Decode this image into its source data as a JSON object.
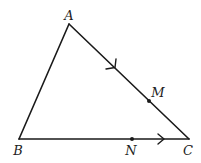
{
  "diagram": {
    "type": "geometry-triangle",
    "colors": {
      "stroke": "#1a1a1a",
      "label": "#222222",
      "background": "#ffffff"
    },
    "vertices": [
      {
        "id": "A",
        "label": "A",
        "x": 69,
        "y": 24,
        "label_x": 69,
        "label_y": 20
      },
      {
        "id": "B",
        "label": "B",
        "x": 19,
        "y": 139,
        "label_x": 18,
        "label_y": 155
      },
      {
        "id": "C",
        "label": "C",
        "x": 189,
        "y": 139,
        "label_x": 188,
        "label_y": 155
      }
    ],
    "points": [
      {
        "id": "M",
        "label": "M",
        "on_segment": "AC",
        "x": 149,
        "y": 101,
        "label_x": 158,
        "label_y": 97
      },
      {
        "id": "N",
        "label": "N",
        "on_segment": "BC",
        "x": 132,
        "y": 139,
        "label_x": 131,
        "label_y": 155
      }
    ],
    "segments": [
      {
        "from": "A",
        "to": "B",
        "arrow": false
      },
      {
        "from": "A",
        "to": "C",
        "arrow": true,
        "arrow_direction": "A-to-C"
      },
      {
        "from": "B",
        "to": "C",
        "arrow": true,
        "arrow_direction": "B-to-C"
      }
    ]
  }
}
